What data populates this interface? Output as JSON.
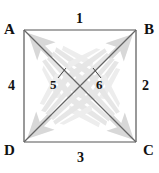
{
  "figure": {
    "width": 159,
    "height": 173,
    "background_color": "#ffffff"
  },
  "colors": {
    "line": "#555555",
    "text": "#111111",
    "arrow_fill": "#d8d8d8",
    "arrow_feather": "#e4e4e4"
  },
  "vertices": [
    {
      "id": "A",
      "label": "A",
      "position": "top-left",
      "x": 24,
      "y": 30
    },
    {
      "id": "B",
      "label": "B",
      "position": "top-right",
      "x": 136,
      "y": 30
    },
    {
      "id": "C",
      "label": "C",
      "position": "bottom-right",
      "x": 136,
      "y": 142
    },
    {
      "id": "D",
      "label": "D",
      "position": "bottom-left",
      "x": 24,
      "y": 142
    }
  ],
  "sides": [
    {
      "id": "1",
      "label": "1",
      "edge": "AB",
      "position": "top"
    },
    {
      "id": "2",
      "label": "2",
      "edge": "BC",
      "position": "right"
    },
    {
      "id": "3",
      "label": "3",
      "edge": "DC",
      "position": "bottom"
    },
    {
      "id": "4",
      "label": "4",
      "edge": "AD",
      "position": "left"
    }
  ],
  "angles": [
    {
      "id": "5",
      "label": "5",
      "position": "center-left",
      "on": "diagonal-AC"
    },
    {
      "id": "6",
      "label": "6",
      "position": "center-right",
      "on": "diagonal-BD"
    }
  ],
  "diagonals": [
    {
      "id": "AC",
      "from": "A",
      "to": "C"
    },
    {
      "id": "BD",
      "from": "B",
      "to": "D"
    }
  ],
  "arrows": [
    {
      "id": "arrow-to-A",
      "points_to": "A",
      "direction": "up-left",
      "style": "feathered"
    },
    {
      "id": "arrow-to-B",
      "points_to": "B",
      "direction": "up-right",
      "style": "feathered"
    },
    {
      "id": "arrow-to-C",
      "points_to": "C",
      "direction": "down-right",
      "style": "feathered"
    },
    {
      "id": "arrow-to-D",
      "points_to": "D",
      "direction": "down-left",
      "style": "feathered"
    }
  ]
}
